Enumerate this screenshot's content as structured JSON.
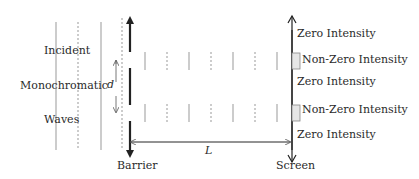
{
  "diagram": {
    "incident_labels": [
      "Incident",
      "Monochromatic",
      "Waves"
    ],
    "slit_spacing_label": "d",
    "distance_label": "L",
    "barrier_label": "Barrier",
    "screen_label": "Screen",
    "screen_regions": [
      {
        "label": "Zero Intensity",
        "type": "zero"
      },
      {
        "label": "Non-Zero Intensity",
        "type": "nonzero"
      },
      {
        "label": "Zero Intensity",
        "type": "zero"
      },
      {
        "label": "Non-Zero Intensity",
        "type": "nonzero"
      },
      {
        "label": "Zero Intensity",
        "type": "zero"
      }
    ],
    "colors": {
      "line": "#333333",
      "wave_line": "#999999",
      "intensity_box_fill": "#e6e6e6",
      "intensity_box_stroke": "#888888"
    }
  }
}
